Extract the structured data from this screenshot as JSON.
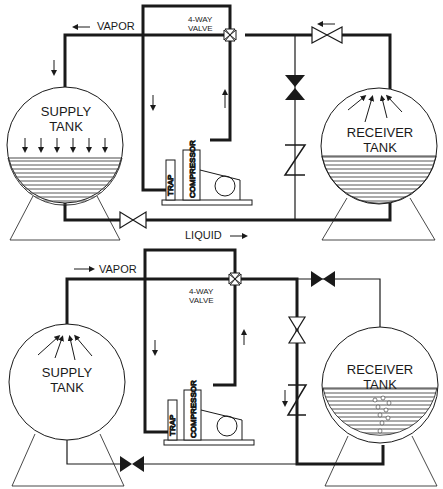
{
  "diagram": {
    "top_panel": {
      "vapor_label": "VAPOR",
      "valve_label_line1": "4-WAY",
      "valve_label_line2": "VALVE",
      "liquid_label": "LIQUID",
      "supply_tank_line1": "SUPPLY",
      "supply_tank_line2": "TANK",
      "receiver_tank_line1": "RECEIVER",
      "receiver_tank_line2": "TANK",
      "trap_label": "TRAP",
      "compressor_label": "COMPRESSOR"
    },
    "bottom_panel": {
      "vapor_label": "VAPOR",
      "valve_label_line1": "4-WAY",
      "valve_label_line2": "VALVE",
      "supply_tank_line1": "SUPPLY",
      "supply_tank_line2": "TANK",
      "receiver_tank_line1": "RECEIVER",
      "receiver_tank_line2": "TANK",
      "trap_label": "TRAP",
      "compressor_label": "COMPRESSOR"
    },
    "colors": {
      "line": "#1a1a1a",
      "background": "#ffffff",
      "liquid_fill": "#888888"
    }
  }
}
